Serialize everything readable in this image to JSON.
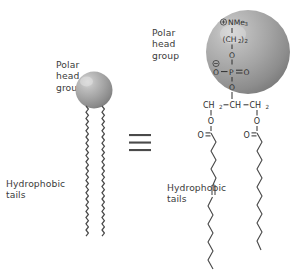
{
  "diagram": {
    "equivalence_symbol": "≡",
    "background_color": "#ffffff",
    "sphere_color": "#9a9a9a",
    "line_color": "#3b3b3b"
  },
  "left_model": {
    "polar_head_label": "Polar\nhead\ngroup",
    "hydrophobic_label": "Hydrophobic\ntails",
    "head_shape": "sphere",
    "tail_count": 2,
    "tail_style": "wavy"
  },
  "right_structure": {
    "polar_head_label": "Polar\nhead\ngroup",
    "hydrophobic_label": "Hydrophobic\ntails",
    "head_group": {
      "charge_positive": "⊕",
      "charge_negative": "⊖",
      "choline": "NMe",
      "choline_sub": "3",
      "ethylene": "(CH",
      "ethylene_sub_a": "2",
      "ethylene_close": ")",
      "ethylene_sub_b": "2",
      "oxygen": "O",
      "phosphorus": "P",
      "phosphate_double_bond_o": "O",
      "phosphate_anion_o": "O"
    },
    "glycerol": {
      "c1": "CH",
      "c1_sub": "2",
      "c2": "CH",
      "c3": "CH",
      "c3_sub": "2",
      "ester_oxygen": "O",
      "carbonyl_oxygen": "O",
      "carbonyl_carbon": "C"
    },
    "tails": {
      "left_tail_unsaturated": true,
      "right_tail_unsaturated": false,
      "double_bond_marker": "‖"
    }
  }
}
